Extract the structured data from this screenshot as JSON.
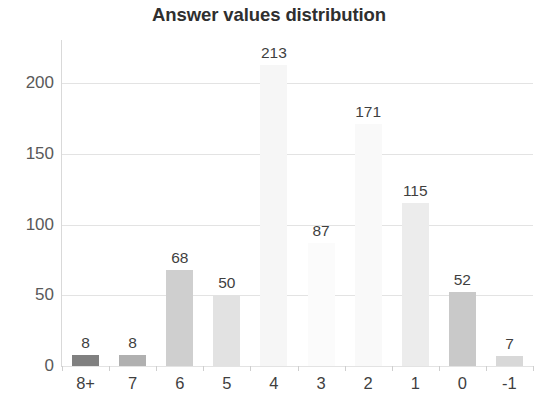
{
  "chart_data": {
    "type": "bar",
    "title": "Answer values distribution",
    "xlabel": "",
    "ylabel": "",
    "categories": [
      "8+",
      "7",
      "6",
      "5",
      "4",
      "3",
      "2",
      "1",
      "0",
      "-1"
    ],
    "values": [
      8,
      8,
      68,
      50,
      213,
      87,
      171,
      115,
      52,
      7
    ],
    "data_labels": [
      "8",
      "8",
      "68",
      "50",
      "213",
      "87",
      "171",
      "115",
      "52",
      "7"
    ],
    "bar_colors": [
      "#808080",
      "#b0b0b0",
      "#cfcfcf",
      "#e2e2e2",
      "#f6f6f6",
      "#fbfbfb",
      "#f9f9f9",
      "#ececec",
      "#c9c9c9",
      "#d8d8d8"
    ],
    "ylim": [
      0,
      215
    ],
    "yticks": [
      0,
      50,
      100,
      150,
      200
    ],
    "ytick_labels": [
      "0",
      "50",
      "100",
      "150",
      "200"
    ],
    "grid": true,
    "gridline_color": "#e3e3e3",
    "legend": null,
    "background": "#ffffff",
    "title_color": "#2f2f2f",
    "tick_label_color": "#3f3f3f"
  }
}
